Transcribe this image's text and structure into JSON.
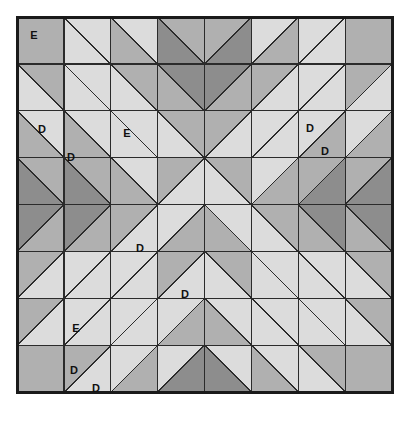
{
  "figure": {
    "kind": "quilt-block-diagram",
    "width": 406,
    "height": 434,
    "background": "#ffffff"
  },
  "palette": {
    "light": "#dcdcdc",
    "medium": "#b0b0b0",
    "dark": "#8d8d8d",
    "line": "#2b2b2b",
    "border": "#1a1a1a",
    "label_text": "#101010"
  },
  "grid": {
    "columns": 8,
    "rows": 8,
    "cell_size": 46.9,
    "origin_x": 17,
    "origin_y": 17,
    "border_width": 3,
    "line_width": 1.3
  },
  "legend": {
    "fabric_codes": [
      "D",
      "E"
    ],
    "d_label": "D",
    "e_label": "E"
  },
  "labels": [
    {
      "text": "E",
      "x": 34,
      "y": 36
    },
    {
      "text": "D",
      "x": 42,
      "y": 130
    },
    {
      "text": "D",
      "x": 71,
      "y": 158
    },
    {
      "text": "E",
      "x": 127,
      "y": 134
    },
    {
      "text": "D",
      "x": 310,
      "y": 129
    },
    {
      "text": "D",
      "x": 325,
      "y": 152
    },
    {
      "text": "D",
      "x": 140,
      "y": 249
    },
    {
      "text": "D",
      "x": 185,
      "y": 295
    },
    {
      "text": "E",
      "x": 76,
      "y": 329
    },
    {
      "text": "D",
      "x": 74,
      "y": 371
    },
    {
      "text": "D",
      "x": 96,
      "y": 389
    }
  ],
  "cells": [
    {
      "r": 0,
      "c": 0,
      "type": "solid",
      "a": "medium",
      "b": "medium"
    },
    {
      "r": 0,
      "c": 1,
      "type": "diag_tlbr",
      "a": "light",
      "b": "light"
    },
    {
      "r": 0,
      "c": 2,
      "type": "diag_tlbr",
      "a": "medium",
      "b": "light"
    },
    {
      "r": 0,
      "c": 3,
      "type": "diag_tlbr",
      "a": "dark",
      "b": "medium"
    },
    {
      "r": 0,
      "c": 4,
      "type": "diag_trbl",
      "a": "dark",
      "b": "medium"
    },
    {
      "r": 0,
      "c": 5,
      "type": "diag_trbl",
      "a": "medium",
      "b": "light"
    },
    {
      "r": 0,
      "c": 6,
      "type": "diag_trbl",
      "a": "light",
      "b": "light"
    },
    {
      "r": 0,
      "c": 7,
      "type": "solid",
      "a": "medium",
      "b": "medium"
    },
    {
      "r": 1,
      "c": 0,
      "type": "diag_tlbr",
      "a": "light",
      "b": "medium"
    },
    {
      "r": 1,
      "c": 1,
      "type": "diag_tlbr",
      "a": "light",
      "b": "light"
    },
    {
      "r": 1,
      "c": 2,
      "type": "diag_tlbr",
      "a": "light",
      "b": "medium"
    },
    {
      "r": 1,
      "c": 3,
      "type": "diag_tlbr",
      "a": "medium",
      "b": "dark"
    },
    {
      "r": 1,
      "c": 4,
      "type": "diag_trbl",
      "a": "medium",
      "b": "dark"
    },
    {
      "r": 1,
      "c": 5,
      "type": "diag_trbl",
      "a": "light",
      "b": "medium"
    },
    {
      "r": 1,
      "c": 6,
      "type": "diag_trbl",
      "a": "light",
      "b": "light"
    },
    {
      "r": 1,
      "c": 7,
      "type": "diag_trbl",
      "a": "light",
      "b": "medium"
    },
    {
      "r": 2,
      "c": 0,
      "type": "diag_tlbr",
      "a": "medium",
      "b": "light"
    },
    {
      "r": 2,
      "c": 1,
      "type": "diag_tlbr",
      "a": "medium",
      "b": "light"
    },
    {
      "r": 2,
      "c": 2,
      "type": "diag_tlbr",
      "a": "light",
      "b": "light"
    },
    {
      "r": 2,
      "c": 3,
      "type": "diag_tlbr",
      "a": "light",
      "b": "medium"
    },
    {
      "r": 2,
      "c": 4,
      "type": "diag_trbl",
      "a": "light",
      "b": "medium"
    },
    {
      "r": 2,
      "c": 5,
      "type": "diag_trbl",
      "a": "light",
      "b": "light"
    },
    {
      "r": 2,
      "c": 6,
      "type": "diag_trbl",
      "a": "medium",
      "b": "light"
    },
    {
      "r": 2,
      "c": 7,
      "type": "diag_trbl",
      "a": "medium",
      "b": "light"
    },
    {
      "r": 3,
      "c": 0,
      "type": "diag_tlbr",
      "a": "dark",
      "b": "medium"
    },
    {
      "r": 3,
      "c": 1,
      "type": "diag_tlbr",
      "a": "dark",
      "b": "medium"
    },
    {
      "r": 3,
      "c": 2,
      "type": "diag_tlbr",
      "a": "medium",
      "b": "light"
    },
    {
      "r": 3,
      "c": 3,
      "type": "diag_trbl",
      "a": "light",
      "b": "medium"
    },
    {
      "r": 3,
      "c": 4,
      "type": "diag_tlbr",
      "a": "light",
      "b": "medium"
    },
    {
      "r": 3,
      "c": 5,
      "type": "diag_trbl",
      "a": "medium",
      "b": "light"
    },
    {
      "r": 3,
      "c": 6,
      "type": "diag_trbl",
      "a": "dark",
      "b": "medium"
    },
    {
      "r": 3,
      "c": 7,
      "type": "diag_trbl",
      "a": "dark",
      "b": "medium"
    },
    {
      "r": 4,
      "c": 0,
      "type": "diag_trbl",
      "a": "medium",
      "b": "dark"
    },
    {
      "r": 4,
      "c": 1,
      "type": "diag_trbl",
      "a": "medium",
      "b": "dark"
    },
    {
      "r": 4,
      "c": 2,
      "type": "diag_trbl",
      "a": "light",
      "b": "medium"
    },
    {
      "r": 4,
      "c": 3,
      "type": "diag_trbl",
      "a": "medium",
      "b": "light"
    },
    {
      "r": 4,
      "c": 4,
      "type": "diag_tlbr",
      "a": "medium",
      "b": "light"
    },
    {
      "r": 4,
      "c": 5,
      "type": "diag_tlbr",
      "a": "light",
      "b": "medium"
    },
    {
      "r": 4,
      "c": 6,
      "type": "diag_tlbr",
      "a": "medium",
      "b": "dark"
    },
    {
      "r": 4,
      "c": 7,
      "type": "diag_tlbr",
      "a": "medium",
      "b": "dark"
    },
    {
      "r": 5,
      "c": 0,
      "type": "diag_trbl",
      "a": "light",
      "b": "medium"
    },
    {
      "r": 5,
      "c": 1,
      "type": "diag_trbl",
      "a": "light",
      "b": "light"
    },
    {
      "r": 5,
      "c": 2,
      "type": "diag_trbl",
      "a": "light",
      "b": "light"
    },
    {
      "r": 5,
      "c": 3,
      "type": "diag_trbl",
      "a": "light",
      "b": "medium"
    },
    {
      "r": 5,
      "c": 4,
      "type": "diag_tlbr",
      "a": "light",
      "b": "medium"
    },
    {
      "r": 5,
      "c": 5,
      "type": "diag_tlbr",
      "a": "light",
      "b": "light"
    },
    {
      "r": 5,
      "c": 6,
      "type": "diag_tlbr",
      "a": "light",
      "b": "light"
    },
    {
      "r": 5,
      "c": 7,
      "type": "diag_tlbr",
      "a": "light",
      "b": "medium"
    },
    {
      "r": 6,
      "c": 0,
      "type": "diag_trbl",
      "a": "light",
      "b": "medium"
    },
    {
      "r": 6,
      "c": 1,
      "type": "diag_trbl",
      "a": "light",
      "b": "light"
    },
    {
      "r": 6,
      "c": 2,
      "type": "diag_trbl",
      "a": "light",
      "b": "light"
    },
    {
      "r": 6,
      "c": 3,
      "type": "diag_trbl",
      "a": "medium",
      "b": "light"
    },
    {
      "r": 6,
      "c": 4,
      "type": "diag_tlbr",
      "a": "medium",
      "b": "light"
    },
    {
      "r": 6,
      "c": 5,
      "type": "diag_tlbr",
      "a": "light",
      "b": "light"
    },
    {
      "r": 6,
      "c": 6,
      "type": "diag_tlbr",
      "a": "light",
      "b": "light"
    },
    {
      "r": 6,
      "c": 7,
      "type": "diag_tlbr",
      "a": "light",
      "b": "medium"
    },
    {
      "r": 7,
      "c": 0,
      "type": "solid",
      "a": "medium",
      "b": "medium"
    },
    {
      "r": 7,
      "c": 1,
      "type": "diag_trbl",
      "a": "light",
      "b": "medium"
    },
    {
      "r": 7,
      "c": 2,
      "type": "diag_trbl",
      "a": "medium",
      "b": "light"
    },
    {
      "r": 7,
      "c": 3,
      "type": "diag_trbl",
      "a": "dark",
      "b": "light"
    },
    {
      "r": 7,
      "c": 4,
      "type": "diag_tlbr",
      "a": "dark",
      "b": "light"
    },
    {
      "r": 7,
      "c": 5,
      "type": "diag_tlbr",
      "a": "medium",
      "b": "light"
    },
    {
      "r": 7,
      "c": 6,
      "type": "diag_tlbr",
      "a": "light",
      "b": "medium"
    },
    {
      "r": 7,
      "c": 7,
      "type": "solid",
      "a": "medium",
      "b": "medium"
    }
  ]
}
